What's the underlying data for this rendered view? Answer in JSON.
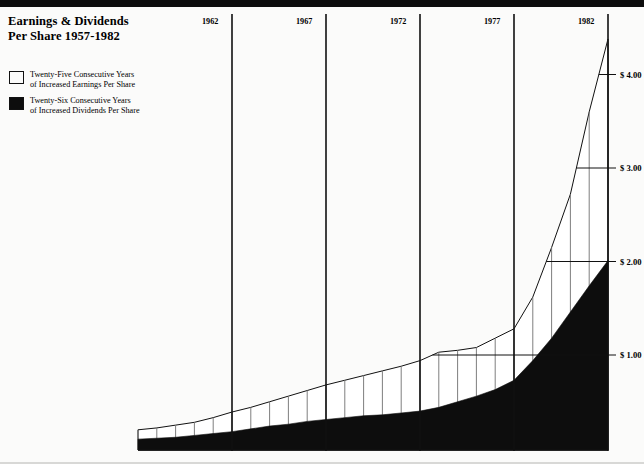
{
  "title": {
    "line1": "Earnings & Dividends",
    "line2": "Per Share 1957-1982"
  },
  "legend": {
    "items": [
      {
        "swatch": "white",
        "line1": "Twenty-Five Consecutive Years",
        "line2": "of Increased Earnings Per Share"
      },
      {
        "swatch": "black",
        "line1": "Twenty-Six Consecutive Years",
        "line2": "of Increased Dividends Per Share"
      }
    ]
  },
  "colors": {
    "dividends": "#0d0d0d",
    "earnings": "#ffffff",
    "line": "#111111",
    "grid": "#6f6f6f",
    "background": "#fbfbfa"
  },
  "chart_data": {
    "type": "area",
    "title": "Earnings & Dividends Per Share 1957-1982",
    "xlabel": "",
    "ylabel": "",
    "grid": true,
    "legend_position": "top-left",
    "x": [
      1957,
      1958,
      1959,
      1960,
      1961,
      1962,
      1963,
      1964,
      1965,
      1966,
      1967,
      1968,
      1969,
      1970,
      1971,
      1972,
      1973,
      1974,
      1975,
      1976,
      1977,
      1978,
      1979,
      1980,
      1981,
      1982
    ],
    "xticks": [
      1962,
      1967,
      1972,
      1977,
      1982
    ],
    "xticklabels": [
      "1962",
      "1967",
      "1972",
      "1977",
      "1982"
    ],
    "yticks": [
      1.0,
      2.0,
      3.0,
      4.0
    ],
    "yticklabels": [
      "$ 1.00",
      "$ 2.00",
      "$ 3.00",
      "$ 4.00"
    ],
    "ylim": [
      0,
      4.45
    ],
    "xlim": [
      1957,
      1982
    ],
    "series": [
      {
        "name": "Twenty-Five Consecutive Years of Increased Earnings Per Share",
        "fill": "#ffffff",
        "values": [
          0.2,
          0.22,
          0.25,
          0.28,
          0.33,
          0.39,
          0.44,
          0.5,
          0.56,
          0.62,
          0.68,
          0.73,
          0.78,
          0.83,
          0.88,
          0.94,
          1.03,
          1.05,
          1.08,
          1.18,
          1.28,
          1.62,
          2.15,
          2.72,
          3.6,
          4.38
        ]
      },
      {
        "name": "Twenty-Six Consecutive Years of Increased Dividends Per Share",
        "fill": "#0d0d0d",
        "values": [
          0.1,
          0.11,
          0.12,
          0.14,
          0.16,
          0.18,
          0.21,
          0.24,
          0.26,
          0.29,
          0.31,
          0.33,
          0.35,
          0.36,
          0.38,
          0.4,
          0.44,
          0.5,
          0.56,
          0.63,
          0.73,
          0.94,
          1.18,
          1.46,
          1.74,
          2.01
        ]
      }
    ]
  }
}
